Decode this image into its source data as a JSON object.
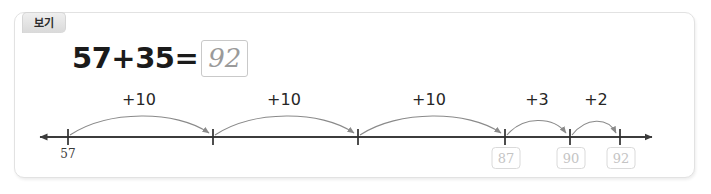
{
  "panel": {
    "tab_label": "보기"
  },
  "equation": {
    "expression": "57+35=",
    "answer": "92"
  },
  "numberline": {
    "start_label": "57",
    "jumps": [
      {
        "label": "+10",
        "end_value": ""
      },
      {
        "label": "+10",
        "end_value": ""
      },
      {
        "label": "+10",
        "end_value": "87"
      },
      {
        "label": "+3",
        "end_value": "90"
      },
      {
        "label": "+2",
        "end_value": "92"
      }
    ],
    "colors": {
      "axis": "#3c3c3c",
      "arc": "#8a8a8a",
      "answer_text": "#c4c4c4",
      "box_border": "#dadada"
    }
  }
}
